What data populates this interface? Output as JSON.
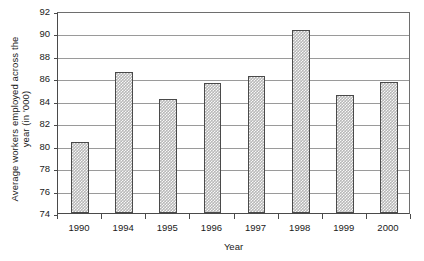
{
  "chart_data": {
    "type": "bar",
    "title": "",
    "xlabel": "Year",
    "ylabel_line1": "Average workers employed across the",
    "ylabel_line2": "year (in '000)",
    "categories": [
      "1990",
      "1994",
      "1995",
      "1996",
      "1997",
      "1998",
      "1999",
      "2000"
    ],
    "values": [
      80.3,
      86.6,
      84.2,
      85.6,
      86.2,
      90.3,
      84.5,
      85.7
    ],
    "ylim": [
      74,
      92
    ],
    "ytick_step": 2,
    "ytick_labels": [
      "92",
      "90",
      "88",
      "86",
      "84",
      "82",
      "80",
      "78",
      "76",
      "74"
    ],
    "ytick_values": [
      92,
      90,
      88,
      86,
      84,
      82,
      80,
      78,
      76,
      74
    ],
    "grid": true,
    "legend": false,
    "bar_fill_color": "#b8b8b8",
    "bar_border_color": "#4a4a4a",
    "gridline_color": "#9a9a9a",
    "axis_color": "#4a4a4a",
    "background_color": "#ffffff"
  }
}
